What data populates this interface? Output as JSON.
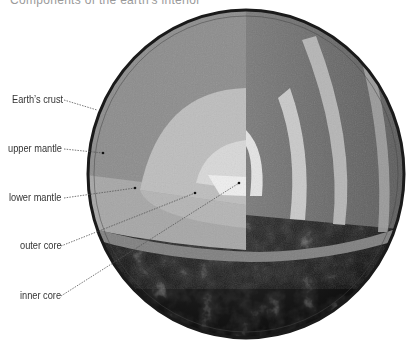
{
  "title_fragment": "Components of the earth's interior",
  "diagram": {
    "labels": [
      {
        "id": "crust",
        "text": "Earth’s crust",
        "x": 12,
        "y": 85,
        "target": [
          97,
          110
        ]
      },
      {
        "id": "upper-mantle",
        "text": "upper mantle",
        "x": 8,
        "y": 143,
        "target": [
          103,
          153
        ]
      },
      {
        "id": "lower-mantle",
        "text": "lower mantle",
        "x": 9,
        "y": 192,
        "target": [
          135,
          188
        ]
      },
      {
        "id": "outer-core",
        "text": "outer core",
        "x": 20,
        "y": 240,
        "target": [
          195,
          193
        ]
      },
      {
        "id": "inner-core",
        "text": "inner core",
        "x": 20,
        "y": 290,
        "target": [
          239,
          183
        ]
      }
    ]
  },
  "colors": {
    "label_text": "#333333",
    "leader": "#555555",
    "crust_surface": "#2a2a2a",
    "mantle_upper": "#8a8a8a",
    "mantle_lower": "#a9a9a9",
    "outer_core": "#c4c4c4",
    "inner_core": "#e2e2e2"
  }
}
